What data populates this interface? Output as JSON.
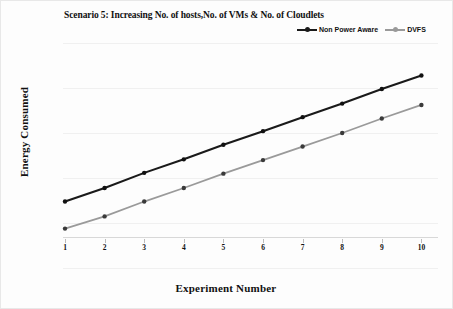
{
  "chart_data": {
    "type": "line",
    "title": "Scenario 5: Increasing No. of hosts,No. of VMs & No. of Cloudlets",
    "xlabel": "Experiment Number",
    "ylabel": "Energy Consumed",
    "yscale": "log",
    "ylim": [
      0.1,
      10000
    ],
    "ytick_labels": [
      "10000",
      "1000",
      "100",
      "10",
      "1",
      "0.1"
    ],
    "ytick_values": [
      10000,
      1000,
      100,
      10,
      1,
      0.1
    ],
    "xtick_labels": [
      "1",
      "2",
      "3",
      "4",
      "5",
      "6",
      "7",
      "8",
      "9",
      "10"
    ],
    "categories": [
      1,
      2,
      3,
      4,
      5,
      6,
      7,
      8,
      9,
      10
    ],
    "grid": true,
    "legend_position": "top-right",
    "series": [
      {
        "name": "Non Power Aware",
        "color": "#1a1a1a",
        "marker": "circle",
        "values": [
          3,
          6,
          13,
          26,
          55,
          110,
          225,
          450,
          950,
          1900
        ]
      },
      {
        "name": "DVFS",
        "color": "#9a9a9a",
        "marker": "circle",
        "values": [
          0.75,
          1.4,
          3,
          6,
          12.5,
          25,
          50,
          100,
          210,
          420
        ]
      }
    ]
  },
  "legend": {
    "entries": [
      {
        "label": "Non Power Aware"
      },
      {
        "label": "DVFS"
      }
    ]
  },
  "colors": {
    "series_non_power_aware": "#1a1a1a",
    "series_dvfs": "#9a9a9a",
    "gridline": "#f0f0f0",
    "text": "#111111",
    "background": "#fdfdfd"
  }
}
